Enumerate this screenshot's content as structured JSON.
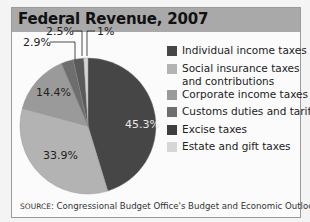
{
  "header": {
    "title": "Federal Revenue, 2007"
  },
  "chart_data": {
    "type": "pie",
    "title": "Federal Revenue, 2007",
    "categories": [
      "Individual income taxes",
      "Social insurance taxes and contributions",
      "Corporate income taxes",
      "Customs duties and tariffs",
      "Excise taxes",
      "Estate and gift taxes"
    ],
    "values": [
      45.3,
      33.9,
      14.4,
      2.9,
      2.5,
      1.0
    ],
    "labels": [
      "45.3%",
      "33.9%",
      "14.4%",
      "2.9%",
      "2.5%",
      "1%"
    ],
    "colors": [
      "#464646",
      "#b3b3b3",
      "#9a9a9a",
      "#6e6e6e",
      "#5a5a5a",
      "#d6d6d6"
    ],
    "legend_position": "right",
    "source": "SOURCE: Congressional Budget Office's Budget and Economic Outlook"
  },
  "legend": {
    "items": [
      {
        "label": "Individual income taxes",
        "color": "#464646"
      },
      {
        "label": "Social insurance taxes",
        "label2": "and contributions",
        "color": "#b3b3b3"
      },
      {
        "label": "Corporate income taxes",
        "color": "#9a9a9a"
      },
      {
        "label": "Customs duties and tariffs",
        "color": "#6e6e6e"
      },
      {
        "label": "Excise taxes",
        "color": "#3e3e3e"
      },
      {
        "label": "Estate and gift taxes",
        "color": "#d6d6d6"
      }
    ]
  },
  "slice_labels": {
    "individual": "45.3%",
    "social": "33.9%",
    "corporate": "14.4%",
    "customs": "2.9%",
    "excise": "2.5%",
    "estate": "1%"
  },
  "footer": {
    "source_prefix": "SOURCE",
    "source_text": ": Congressional Budget Office's Budget and Economic Outlook"
  }
}
